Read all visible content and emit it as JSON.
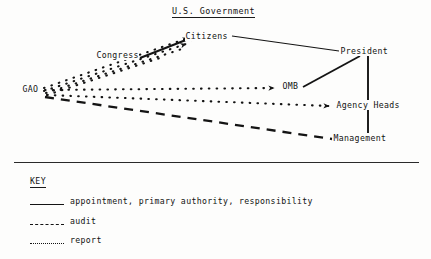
{
  "title": "U.S. Government",
  "diagram": {
    "nodes": [
      {
        "id": "citizens",
        "label": "Citizens",
        "x": 185,
        "y": 31
      },
      {
        "id": "congress",
        "label": "Congress",
        "x": 96,
        "y": 50
      },
      {
        "id": "gao",
        "label": "GAO",
        "x": 22,
        "y": 84
      },
      {
        "id": "president",
        "label": "President",
        "x": 340,
        "y": 46
      },
      {
        "id": "omb",
        "label": "OMB",
        "x": 282,
        "y": 81
      },
      {
        "id": "agency_heads",
        "label": "Agency Heads",
        "x": 336,
        "y": 100
      },
      {
        "id": "management",
        "label": "Management",
        "x": 333,
        "y": 133
      }
    ],
    "edges": [
      {
        "from": "congress",
        "to": "citizens",
        "style": "solid",
        "arrow": true,
        "name": "congress-to-citizens-appointment"
      },
      {
        "from": "citizens",
        "to": "president",
        "style": "solid",
        "arrow": false,
        "name": "citizens-to-president-appointment"
      },
      {
        "from": "president",
        "to": "omb",
        "style": "solid",
        "arrow": false,
        "name": "president-to-omb-authority"
      },
      {
        "from": "president",
        "to": "agency_heads",
        "style": "solid",
        "arrow": false,
        "name": "president-to-agency-heads-authority"
      },
      {
        "from": "president",
        "to": "management",
        "style": "solid",
        "arrow": false,
        "name": "president-to-management-authority"
      },
      {
        "from": "gao",
        "to": "citizens",
        "style": "dotted",
        "arrow": true,
        "name": "gao-to-citizens-report"
      },
      {
        "from": "gao",
        "to": "congress",
        "style": "dotted",
        "arrow": true,
        "name": "gao-to-congress-report"
      },
      {
        "from": "gao",
        "to": "omb",
        "style": "dotted",
        "arrow": true,
        "name": "gao-to-omb-report"
      },
      {
        "from": "gao",
        "to": "agency_heads",
        "style": "dotted",
        "arrow": true,
        "name": "gao-to-agency-heads-report"
      },
      {
        "from": "gao",
        "to": "management",
        "style": "dashed",
        "arrow": false,
        "name": "gao-to-management-audit"
      }
    ]
  },
  "key": {
    "heading": "KEY",
    "items": [
      {
        "style": "solid",
        "label": "appointment, primary authority, responsibility"
      },
      {
        "style": "dashed",
        "label": "audit"
      },
      {
        "style": "dotted",
        "label": "report"
      }
    ]
  },
  "colors": {
    "ink": "#141414",
    "paper": "#fdfdfc"
  }
}
